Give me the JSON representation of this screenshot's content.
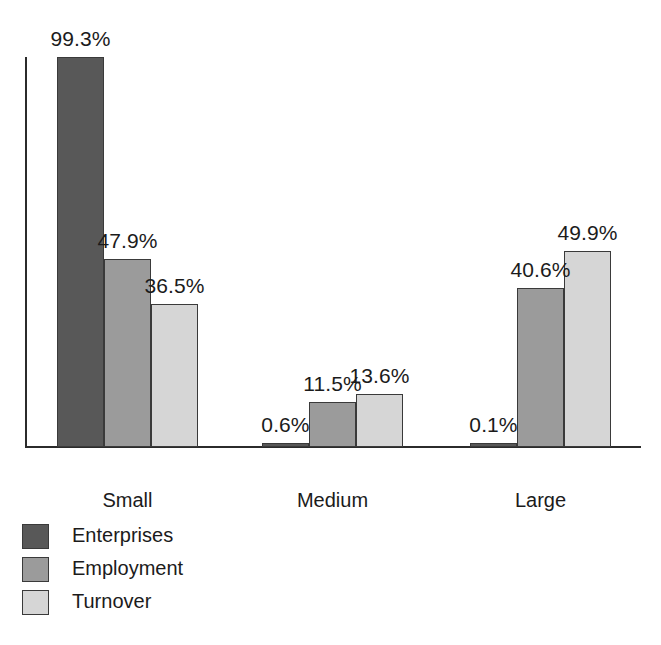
{
  "chart_data": {
    "type": "bar",
    "title": "",
    "xlabel": "",
    "ylabel": "",
    "categories": [
      "Small",
      "Medium",
      "Large"
    ],
    "series": [
      {
        "name": "Enterprises",
        "color": "#585858",
        "values": [
          99.3,
          0.6,
          0.1
        ],
        "labels": [
          "99.3%",
          "0.6%",
          "0.1%"
        ]
      },
      {
        "name": "Employment",
        "color": "#9b9b9b",
        "values": [
          47.9,
          11.5,
          40.6
        ],
        "labels": [
          "47.9%",
          "11.5%",
          "40.6%"
        ]
      },
      {
        "name": "Turnover",
        "color": "#d6d6d6",
        "values": [
          36.5,
          13.6,
          49.9
        ],
        "labels": [
          "36.5%",
          "13.6%",
          "49.9%"
        ]
      }
    ],
    "ylim": [
      0,
      99.3
    ],
    "grid": false,
    "axis_visible": {
      "y": true,
      "x": true
    },
    "legend_position": "bottom-left",
    "value_labels_shown": true,
    "units": "percent"
  },
  "legend": {
    "items": [
      {
        "label": "Enterprises",
        "color": "#585858"
      },
      {
        "label": "Employment",
        "color": "#9b9b9b"
      },
      {
        "label": "Turnover",
        "color": "#d6d6d6"
      }
    ]
  },
  "bottom_caption": {
    "text": ""
  }
}
